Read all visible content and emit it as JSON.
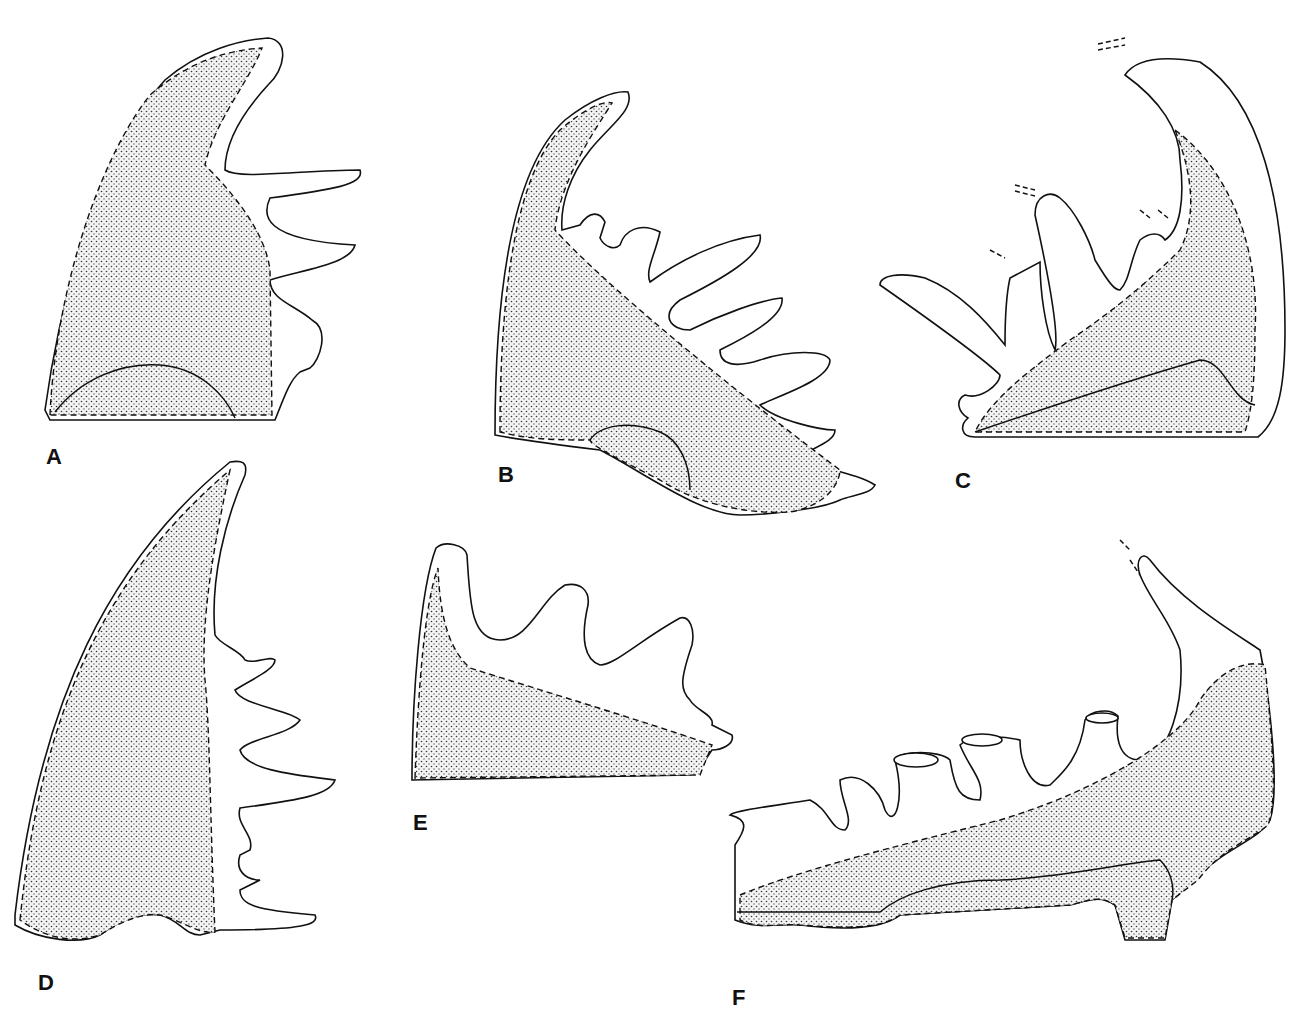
{
  "figure": {
    "panels": [
      {
        "id": "A",
        "label": "A"
      },
      {
        "id": "B",
        "label": "B"
      },
      {
        "id": "C",
        "label": "C"
      },
      {
        "id": "D",
        "label": "D"
      },
      {
        "id": "E",
        "label": "E"
      },
      {
        "id": "F",
        "label": "F"
      }
    ],
    "colors": {
      "line": "#111111",
      "background": "#ffffff",
      "stipple": "#333333"
    }
  }
}
